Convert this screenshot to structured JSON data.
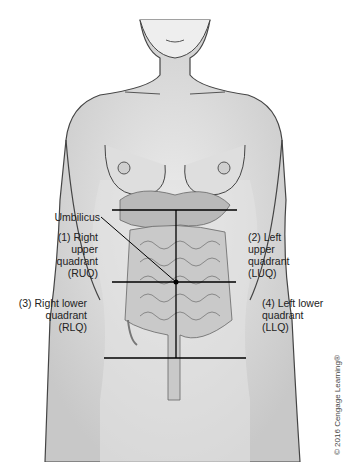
{
  "figure": {
    "labels": {
      "umbilicus": "Umbilicus",
      "ruq": [
        "(1) Right",
        "upper",
        "quadrant",
        "(RUQ)"
      ],
      "luq": [
        "(2) Left",
        "upper",
        "quadrant",
        "(LUQ)"
      ],
      "rlq": [
        "(3) Right lower",
        "quadrant",
        "(RLQ)"
      ],
      "llq": [
        "(4) Left lower",
        "quadrant",
        "(LLQ)"
      ]
    },
    "copyright": "© 2016 Cengage Learning®",
    "colors": {
      "skin": "#d9d9d9",
      "outline": "#333333",
      "line": "#000000",
      "intestine": "#bdbdbd"
    }
  }
}
